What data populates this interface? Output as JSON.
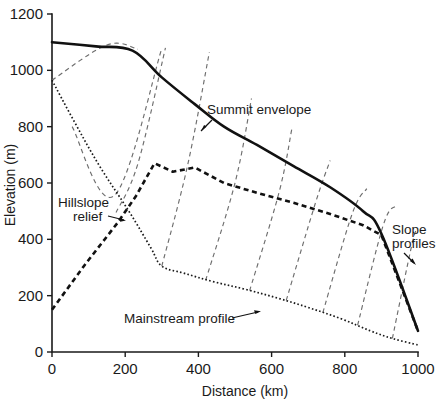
{
  "chart_data": {
    "type": "line",
    "title": "",
    "xlabel": "Distance (km)",
    "ylabel": "Elevation (m)",
    "xlim": [
      0,
      1000
    ],
    "ylim": [
      0,
      1200
    ],
    "xticks": [
      0,
      200,
      400,
      600,
      800,
      1000
    ],
    "yticks": [
      0,
      200,
      400,
      600,
      800,
      1000,
      1200
    ],
    "grid": false,
    "legend_position": "none",
    "series": [
      {
        "name": "Summit envelope",
        "style": "solid",
        "x": [
          0,
          120,
          220,
          300,
          390,
          470,
          560,
          660,
          760,
          850,
          900,
          1000
        ],
        "y": [
          1100,
          1085,
          1070,
          975,
          880,
          800,
          735,
          660,
          585,
          500,
          420,
          75
        ]
      },
      {
        "name": "Hillslope relief",
        "style": "dashed-thick",
        "x": [
          0,
          90,
          180,
          230,
          280,
          330,
          390,
          470,
          560,
          660,
          760,
          850,
          900,
          1000
        ],
        "y": [
          150,
          310,
          460,
          555,
          670,
          640,
          655,
          600,
          565,
          530,
          490,
          450,
          415,
          75
        ]
      },
      {
        "name": "Mainstream profile",
        "style": "dotted",
        "x": [
          0,
          60,
          130,
          210,
          270,
          300,
          360,
          440,
          530,
          620,
          700,
          790,
          870,
          930,
          1000
        ],
        "y": [
          965,
          820,
          660,
          500,
          370,
          305,
          280,
          250,
          222,
          190,
          158,
          118,
          75,
          48,
          25
        ]
      }
    ],
    "slope_profiles": {
      "name": "Slope profiles",
      "style": "dashed-thin",
      "description": "Thin dashed lines connecting the mainstream profile upward to the summit envelope",
      "lines": [
        {
          "x": [
            0,
            150,
            235
          ],
          "y": [
            965,
            1090,
            1075
          ]
        },
        {
          "x": [
            55,
            170,
            300
          ],
          "y": [
            800,
            555,
            1078
          ]
        },
        {
          "x": [
            175,
            235,
            310
          ],
          "y": [
            495,
            670,
            1080
          ]
        },
        {
          "x": [
            300,
            370,
            430
          ],
          "y": [
            305,
            660,
            1065
          ]
        },
        {
          "x": [
            420,
            500,
            545
          ],
          "y": [
            255,
            600,
            900
          ]
        },
        {
          "x": [
            540,
            620,
            655
          ],
          "y": [
            218,
            565,
            790
          ]
        },
        {
          "x": [
            640,
            720,
            760
          ],
          "y": [
            183,
            530,
            680
          ]
        },
        {
          "x": [
            740,
            820,
            860
          ],
          "y": [
            140,
            490,
            580
          ]
        },
        {
          "x": [
            835,
            905,
            940
          ],
          "y": [
            95,
            450,
            520
          ]
        },
        {
          "x": [
            930,
            985,
            1000
          ],
          "y": [
            48,
            390,
            430
          ]
        }
      ]
    },
    "annotations": [
      {
        "label": "Summit envelope",
        "target_series": "Summit envelope",
        "arrow": true
      },
      {
        "label": "Hillslope relief",
        "target_series": "Hillslope relief",
        "arrow": true
      },
      {
        "label": "Mainstream profile",
        "target_series": "Mainstream profile",
        "arrow": true
      },
      {
        "label": "Slope profiles",
        "target_series": "Slope profiles",
        "arrow": true
      }
    ]
  },
  "annotation_text": {
    "summit_envelope": "Summit envelope",
    "hillslope_relief_line1": "Hillslope",
    "hillslope_relief_line2": "relief",
    "mainstream_profile": "Mainstream profile",
    "slope_profiles_line1": "Slope",
    "slope_profiles_line2": "profiles"
  },
  "axis": {
    "x_title": "Distance (km)",
    "y_title": "Elevation (m)",
    "x_tick_labels": [
      "0",
      "200",
      "400",
      "600",
      "800",
      "1000"
    ],
    "y_tick_labels": [
      "0",
      "200",
      "400",
      "600",
      "800",
      "1000",
      "1200"
    ]
  },
  "colors": {
    "ink": "#1a1a1a",
    "slope_profile": "#6e6e6e",
    "background": "#ffffff"
  }
}
